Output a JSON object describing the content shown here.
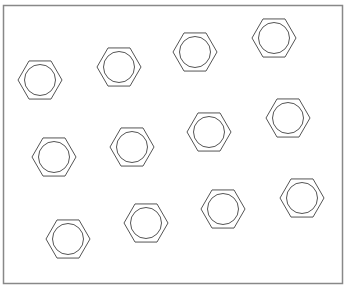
{
  "canvas": {
    "width": 346,
    "height": 289
  },
  "frame": {
    "x": 3.5,
    "y": 5.5,
    "width": 339,
    "height": 278,
    "stroke": "#888888"
  },
  "style": {
    "stroke": "#555555",
    "hex_radius": 22,
    "circle_radius": 15.5
  },
  "shapes": [
    {
      "id": "nut-1",
      "cx": 40,
      "cy": 80
    },
    {
      "id": "nut-2",
      "cx": 119,
      "cy": 67
    },
    {
      "id": "nut-3",
      "cx": 195,
      "cy": 52
    },
    {
      "id": "nut-4",
      "cx": 274,
      "cy": 38
    },
    {
      "id": "nut-5",
      "cx": 54,
      "cy": 157
    },
    {
      "id": "nut-6",
      "cx": 132,
      "cy": 147
    },
    {
      "id": "nut-7",
      "cx": 209,
      "cy": 132
    },
    {
      "id": "nut-8",
      "cx": 288,
      "cy": 118
    },
    {
      "id": "nut-9",
      "cx": 302,
      "cy": 198
    },
    {
      "id": "nut-10",
      "cx": 223,
      "cy": 209
    },
    {
      "id": "nut-11",
      "cx": 146,
      "cy": 223
    },
    {
      "id": "nut-12",
      "cx": 68,
      "cy": 239
    }
  ]
}
